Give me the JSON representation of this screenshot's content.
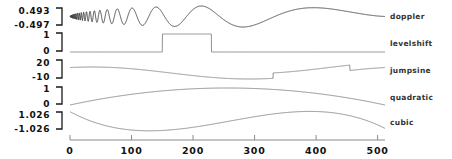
{
  "chart_data": {
    "type": "line",
    "title": "",
    "xlabel": "",
    "ylabel": "",
    "grid": false,
    "legend_position": "right-of-panels",
    "xlim": [
      0,
      512
    ],
    "x_ticks": [
      "0",
      "100",
      "200",
      "300",
      "400",
      "500"
    ],
    "x_tick_values": [
      0,
      100,
      200,
      300,
      400,
      500
    ],
    "panels": [
      {
        "name": "doppler",
        "label": "doppler",
        "ymax_label": "0.493",
        "ymin_label": "-0.497",
        "ylim": [
          -0.497,
          0.493
        ],
        "description": "Doppler chirp: high frequency oscillation decaying in frequency left to right, amplitude envelope rising then falling"
      },
      {
        "name": "levelshift",
        "label": "levelshift",
        "ymax_label": "1",
        "ymin_label": "0",
        "ylim": [
          0,
          1
        ],
        "description": "Flat at 0, step up to 1 from x=150 to x=230, then back to 0",
        "step_start": 150,
        "step_end": 230,
        "step_level": 1,
        "base_level": 0
      },
      {
        "name": "jumpsine",
        "label": "jumpsine",
        "ymax_label": "20",
        "ymin_label": "-10",
        "ylim": [
          -10,
          20
        ],
        "description": "Sine wave with a positive jump near x=330 and a negative jump near x=455",
        "jump_up_at": 330,
        "jump_down_at": 455
      },
      {
        "name": "quadratic",
        "label": "quadratic",
        "ymax_label": "1",
        "ymin_label": "0",
        "ylim": [
          0,
          1
        ],
        "description": "Downward-opening parabola peaking at mid-range"
      },
      {
        "name": "cubic",
        "label": "cubic",
        "ymax_label": "1.026",
        "ymin_label": "-1.026",
        "ylim": [
          -1.026,
          1.026
        ],
        "description": "Cubic curve: rises to a maximum near x=130, falls to a minimum near x=380, rises at the right edge"
      }
    ],
    "series": [
      {
        "name": "doppler",
        "ymin": -0.497,
        "ymax": 0.493
      },
      {
        "name": "levelshift",
        "ymin": 0,
        "ymax": 1
      },
      {
        "name": "jumpsine",
        "ymin": -10,
        "ymax": 20
      },
      {
        "name": "quadratic",
        "ymin": 0,
        "ymax": 1
      },
      {
        "name": "cubic",
        "ymin": -1.026,
        "ymax": 1.026
      }
    ]
  },
  "colors": {
    "background": "#ffffff",
    "trace": "#6e6e6e",
    "axis": "#8a8a8a",
    "text": "#111111"
  }
}
